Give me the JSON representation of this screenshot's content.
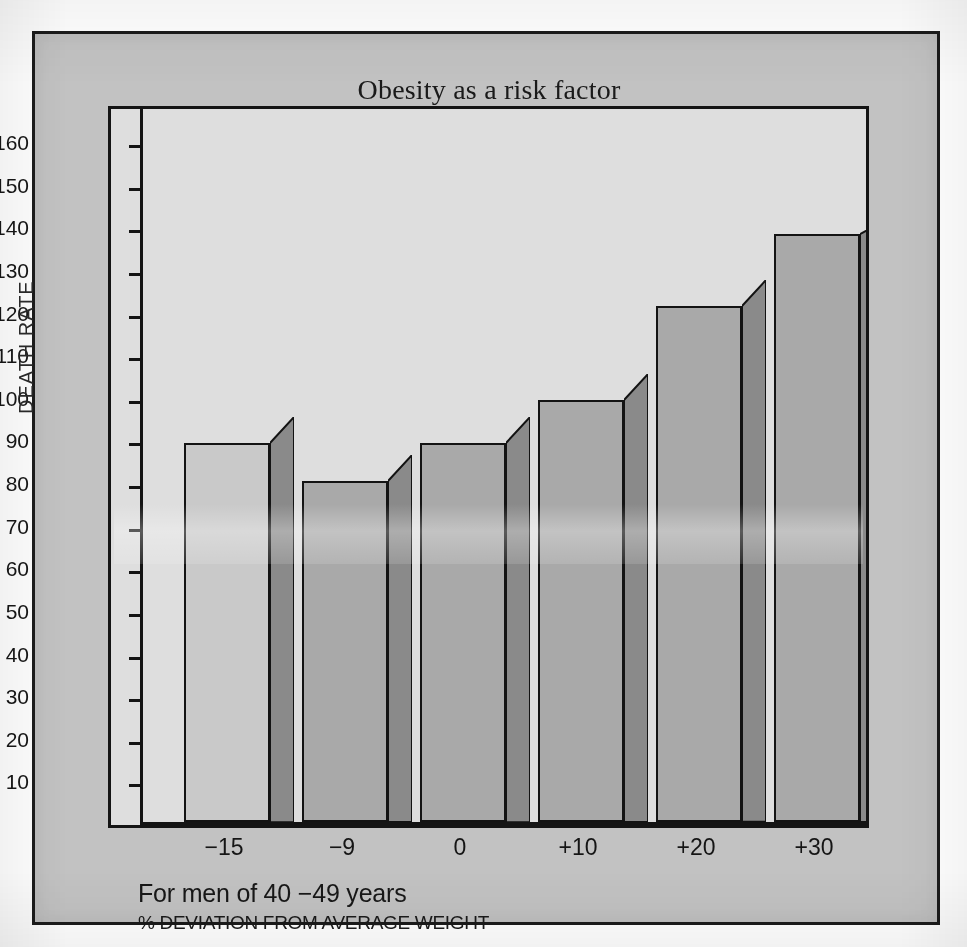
{
  "figure": {
    "title": "Obesity as a risk factor",
    "caption_primary": "For men of 40 −49 years",
    "caption_secondary": "% DEVIATION FROM AVERAGE WEIGHT"
  },
  "colors": {
    "page_background": "#ffffff",
    "frame_background": "#c2c2c2",
    "frame_border": "#1c1c1c",
    "plot_background": "#dedede",
    "axis": "#141414",
    "bar_front_default": "#a9a9a9",
    "bar_front_first": "#c9c9c9",
    "bar_side_default": "#8a8a8a",
    "bar_outline": "#131313",
    "text": "#171717"
  },
  "chart_data": {
    "type": "bar",
    "title": "Obesity as a risk factor",
    "xlabel": "% DEVIATION FROM AVERAGE WEIGHT",
    "ylabel": "DEATH RATE",
    "categories": [
      "−15",
      "−9",
      "0",
      "+10",
      "+20",
      "+30"
    ],
    "values": [
      89,
      80,
      89,
      99,
      121,
      138
    ],
    "ylim": [
      0,
      168
    ],
    "yticks": [
      10,
      20,
      30,
      40,
      50,
      60,
      70,
      80,
      90,
      100,
      110,
      120,
      130,
      140,
      150,
      160
    ],
    "ytick_labels": [
      "10",
      "20",
      "30",
      "40",
      "50",
      "60",
      "70",
      "80",
      "90",
      "100",
      "110",
      "120",
      "130",
      "140",
      "150",
      "160"
    ],
    "grid": false,
    "legend": null,
    "annotations": [
      "For men of 40 −49 years"
    ],
    "style": "3d-extruded-bars",
    "series": [
      {
        "name": "Death rate",
        "values": [
          89,
          80,
          89,
          99,
          121,
          138
        ]
      }
    ]
  }
}
